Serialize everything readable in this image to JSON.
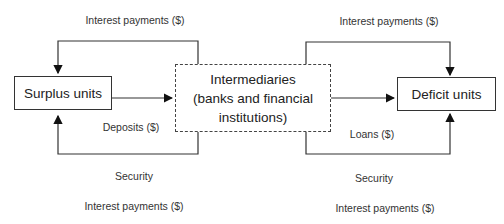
{
  "nodes": {
    "surplus": {
      "label": "Surplus units"
    },
    "intermediaries": {
      "line1": "Intermediaries",
      "line2": "(banks and financial",
      "line3": "institutions)"
    },
    "deficit": {
      "label": "Deficit units"
    }
  },
  "labels": {
    "top_left": "Interest payments ($)",
    "top_right": "Interest payments ($)",
    "deposits": "Deposits ($)",
    "loans": "Loans ($)",
    "security_left": "Security",
    "security_right": "Security",
    "bottom_left": "Interest payments ($)",
    "bottom_right": "Interest payments ($)"
  }
}
